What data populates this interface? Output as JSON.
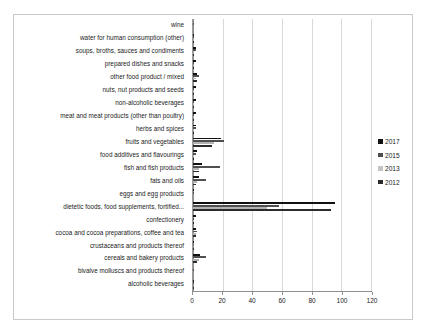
{
  "chart_data": {
    "type": "bar",
    "orientation": "horizontal",
    "title": "",
    "subtitle": "",
    "xlabel": "",
    "ylabel": "",
    "xlim": [
      0,
      120
    ],
    "xticks": [
      0,
      20,
      40,
      60,
      80,
      100,
      120
    ],
    "xtick_labels": [
      "0",
      "20",
      "40",
      "60",
      "80",
      "100",
      "120"
    ],
    "grid": true,
    "grid_axis": "x",
    "legend_position": "right",
    "categories": [
      "wine",
      "water for human consumption (other)",
      "soups, broths, sauces and condiments",
      "prepared dishes and snacks",
      "other food product / mixed",
      "nuts, nut products and seeds",
      "non-alcoholic beverages",
      "meat and meat products (other than poultry)",
      "herbs and spices",
      "fruits and vegetables",
      "food additives and flavourings",
      "fish and fish products",
      "fats and oils",
      "eggs and egg products",
      "dietetic foods, food supplements, fortified...",
      "confectionery",
      "cocoa and cocoa preparations, coffee and tea",
      "crustaceans and products thereof",
      "cereals and bakery products",
      "bivalve molluscs and products thereof",
      "alcoholic beverages"
    ],
    "series": [
      {
        "name": "2017",
        "color": "#111111",
        "values": [
          0,
          1,
          2,
          2,
          3,
          2,
          2,
          2,
          2,
          19,
          3,
          6,
          4,
          1,
          96,
          2,
          2,
          1,
          5,
          0,
          1
        ]
      },
      {
        "name": "2015",
        "color": "#4f4f4f",
        "values": [
          1,
          1,
          2,
          1,
          4,
          1,
          1,
          1,
          2,
          21,
          2,
          18,
          9,
          1,
          58,
          1,
          3,
          1,
          9,
          1,
          1
        ]
      },
      {
        "name": "2013",
        "color": "#b3b3b3",
        "values": [
          0,
          1,
          1,
          1,
          2,
          1,
          1,
          1,
          1,
          14,
          1,
          4,
          3,
          0,
          50,
          1,
          2,
          0,
          4,
          0,
          0
        ]
      },
      {
        "name": "2012",
        "color": "#2b2b2b",
        "values": [
          0,
          1,
          1,
          1,
          3,
          1,
          1,
          1,
          1,
          13,
          1,
          4,
          2,
          0,
          93,
          1,
          2,
          1,
          3,
          0,
          1
        ]
      }
    ]
  },
  "legend": {
    "items": [
      {
        "label": "2017",
        "series_key": "s2017"
      },
      {
        "label": "2015",
        "series_key": "s2015"
      },
      {
        "label": "2013",
        "series_key": "s2013"
      },
      {
        "label": "2012",
        "series_key": "s2012"
      }
    ]
  }
}
